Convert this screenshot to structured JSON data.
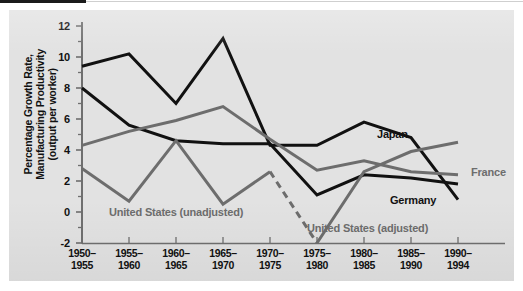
{
  "figure": {
    "background_color": "#e2e2e2",
    "page_color": "#ffffff",
    "axis_color": "#6f6f6f",
    "black_series_color": "#111111",
    "gray_series_color": "#6d6d6d"
  },
  "chart_data": {
    "type": "line",
    "title": "",
    "xlabel": "",
    "ylabel": "Percentage Growth Rate,\nManufacturing Productivity\n(output per worker)",
    "categories": [
      "1950–\n1955",
      "1955–\n1960",
      "1960–\n1965",
      "1965–\n1970",
      "1970–\n1975",
      "1975–\n1980",
      "1980–\n1985",
      "1985–\n1990",
      "1990–\n1994"
    ],
    "x": [
      "1950-1955",
      "1955-1960",
      "1960-1965",
      "1965-1970",
      "1970-1975",
      "1975-1980",
      "1980-1985",
      "1985-1990",
      "1990-1994"
    ],
    "ylim": [
      -2,
      12
    ],
    "yticks": [
      -2,
      0,
      2,
      4,
      6,
      8,
      10,
      12
    ],
    "ytick_labels": [
      "-2",
      "0",
      "2",
      "4",
      "6",
      "8",
      "10",
      "12"
    ],
    "grid": false,
    "legend": "inline-annotations",
    "series": [
      {
        "name": "Japan",
        "color": "#111111",
        "style": "solid",
        "label_text": "Japan",
        "values": [
          9.4,
          10.2,
          7.0,
          11.2,
          4.3,
          4.3,
          5.8,
          4.8,
          0.8
        ]
      },
      {
        "name": "Germany",
        "color": "#111111",
        "style": "solid",
        "label_text": "Germany",
        "values": [
          8.0,
          5.6,
          4.6,
          4.4,
          4.4,
          1.1,
          2.4,
          2.2,
          1.8
        ]
      },
      {
        "name": "France",
        "color": "#6d6d6d",
        "style": "solid",
        "label_text": "France",
        "values": [
          4.3,
          5.2,
          5.9,
          6.8,
          4.7,
          2.7,
          3.3,
          2.6,
          2.4
        ]
      },
      {
        "name": "United States (unadjusted)",
        "color": "#6d6d6d",
        "style": "solid",
        "label_text": "United States (unadjusted)",
        "values": [
          2.8,
          0.7,
          4.6,
          0.5,
          2.6,
          null,
          null,
          null,
          null
        ]
      },
      {
        "name": "United States (dashed transition)",
        "color": "#6d6d6d",
        "style": "dashed",
        "label_text": "",
        "values": [
          null,
          null,
          null,
          null,
          2.6,
          -2.0,
          null,
          null,
          null
        ]
      },
      {
        "name": "United States (adjusted)",
        "color": "#6d6d6d",
        "style": "solid",
        "label_text": "United States (adjusted)",
        "values": [
          null,
          null,
          null,
          null,
          null,
          -2.0,
          2.6,
          3.9,
          4.5
        ]
      }
    ],
    "annotations": [
      {
        "text": "Japan",
        "x": "1985-1990",
        "y": 6.2
      },
      {
        "text": "France",
        "x": "1990-1994",
        "y": 3.2
      },
      {
        "text": "Germany",
        "x": "1985-1990",
        "y": 0.9
      },
      {
        "text": "United States (unadjusted)",
        "x": "1960-1965",
        "y": -0.2
      },
      {
        "text": "United States (adjusted)",
        "x": "1980-1985",
        "y": -1.0
      }
    ]
  }
}
